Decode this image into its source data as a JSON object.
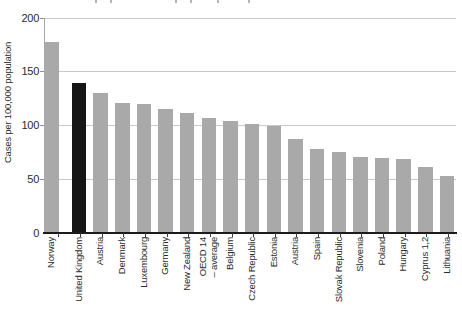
{
  "figure": {
    "cropped_title_fragment_xs": [
      95,
      110,
      175,
      190,
      217,
      248
    ],
    "colors": {
      "bar_default": "#a9a9a9",
      "bar_highlight": "#161616",
      "gridline": "#c9c9c9",
      "axis_line": "#a6a6a6",
      "baseline": "#1b1b1b",
      "text": "#2b2b2b"
    }
  },
  "chart_data": {
    "type": "bar",
    "title": "",
    "xlabel": "",
    "ylabel": "Cases per 100,000 population",
    "ylim": [
      0,
      200
    ],
    "yticks": [
      0,
      50,
      100,
      150,
      200
    ],
    "grid": "horizontal",
    "legend_position": "none",
    "highlight_index": 1,
    "highlight_category": "United Kingdom",
    "categories": [
      "Norway",
      "United Kingdom",
      "Austria",
      "Denmark",
      "Luxembourg",
      "Germany",
      "New Zealand",
      "OECD 14\n– average",
      "Belgium",
      "Czech Republic",
      "Estonia",
      "Austria",
      "Spain",
      "Slovak Republic",
      "Slovenia",
      "Poland",
      "Hungary",
      "Cyprus 1,2",
      "Lithuania"
    ],
    "values": [
      178,
      140,
      130,
      121,
      120,
      115,
      112,
      107,
      104,
      101,
      100,
      87,
      78,
      75,
      71,
      70,
      69,
      61,
      53
    ]
  }
}
